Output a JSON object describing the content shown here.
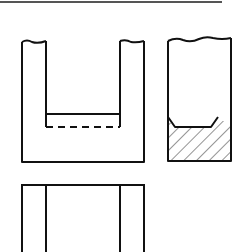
{
  "diagram": {
    "title": "",
    "type": "orthographic-projection",
    "views": [
      {
        "name": "front-view",
        "description": "U-shaped channel with broken top edges, inner bottom surface solid line and hidden edge dashed line"
      },
      {
        "name": "side-view",
        "description": "Rectangular section with wavy break line at top, chamfered inner bottom, hatched solid base section"
      },
      {
        "name": "top-view",
        "description": "Rectangle with two internal vertical lines, cropped at bottom"
      }
    ],
    "colors": {
      "line": "#111111",
      "background": "#ffffff",
      "border_top": "#555555"
    }
  }
}
